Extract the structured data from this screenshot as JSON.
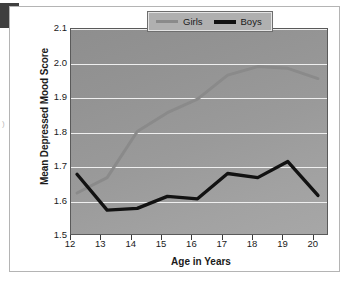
{
  "figure": {
    "y_axis_title": "Mean Depressed Mood Score",
    "x_axis_title": "Age in Years",
    "legend": {
      "girls_label": "Girls",
      "boys_label": "Boys"
    }
  },
  "chart_data": {
    "type": "line",
    "title": "",
    "xlabel": "Age in Years",
    "ylabel": "Mean Depressed Mood Score",
    "xlim": [
      12,
      20.5
    ],
    "ylim": [
      1.5,
      2.1
    ],
    "yticks": [
      1.5,
      1.6,
      1.7,
      1.8,
      1.9,
      2.0,
      2.1
    ],
    "ytick_labels": [
      "1.5",
      "1.6",
      "1.7",
      "1.8",
      "1.9",
      "2.0",
      "2.1"
    ],
    "xticks": [
      12,
      13,
      14,
      15,
      16,
      17,
      18,
      19,
      20
    ],
    "xtick_labels": [
      "12",
      "13",
      "14",
      "15",
      "16",
      "17",
      "18",
      "19",
      "20"
    ],
    "grid": "horizontal",
    "legend_position": "top-right",
    "x": [
      12.2,
      13.2,
      14.2,
      15.2,
      16.2,
      17.2,
      18.2,
      19.2,
      20.2
    ],
    "series": [
      {
        "name": "Girls",
        "color": "#8a8a8a",
        "values": [
          1.62,
          1.665,
          1.8,
          1.855,
          1.895,
          1.965,
          1.99,
          1.985,
          1.955
        ]
      },
      {
        "name": "Boys",
        "color": "#121212",
        "values": [
          1.675,
          1.57,
          1.575,
          1.61,
          1.603,
          1.677,
          1.665,
          1.712,
          1.613
        ]
      }
    ],
    "colors": {
      "girls": "#8a8a8a",
      "boys": "#121212",
      "plot_background": "#9a9a9a",
      "gridline": "#efefef",
      "axis": "#3c3c3c"
    }
  }
}
